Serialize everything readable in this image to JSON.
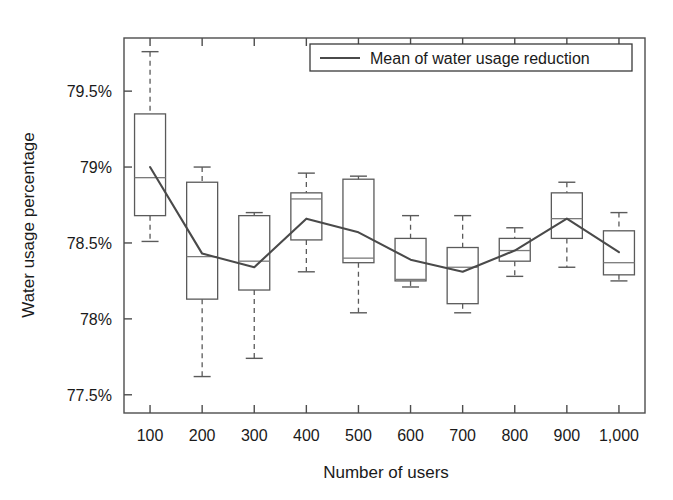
{
  "chart_data": {
    "type": "box",
    "title": "",
    "xlabel": "Number of users",
    "ylabel": "Water usage percentage",
    "categories": [
      "100",
      "200",
      "300",
      "400",
      "500",
      "600",
      "700",
      "800",
      "900",
      "1,000"
    ],
    "ylim": [
      77.38,
      79.85
    ],
    "ytick_values": [
      79.5,
      79,
      78.5,
      78,
      77.5
    ],
    "ytick_labels": [
      "79.5%",
      "79%",
      "78.5%",
      "78%",
      "77.5%"
    ],
    "grid": false,
    "legend_position": "top-right",
    "legend": [
      {
        "label": "Mean of water usage reduction",
        "marker": "line",
        "color": "#4a4a4a"
      }
    ],
    "boxes": [
      {
        "category": "100",
        "whisker_low": 78.51,
        "q1": 78.68,
        "median": 78.93,
        "q3": 79.35,
        "whisker_high": 79.76
      },
      {
        "category": "200",
        "whisker_low": 77.62,
        "q1": 78.13,
        "median": 78.41,
        "q3": 78.9,
        "whisker_high": 79.0
      },
      {
        "category": "300",
        "whisker_low": 77.74,
        "q1": 78.19,
        "median": 78.38,
        "q3": 78.68,
        "whisker_high": 78.7
      },
      {
        "category": "400",
        "whisker_low": 78.31,
        "q1": 78.52,
        "median": 78.79,
        "q3": 78.83,
        "whisker_high": 78.96
      },
      {
        "category": "500",
        "whisker_low": 78.04,
        "q1": 78.37,
        "median": 78.4,
        "q3": 78.92,
        "whisker_high": 78.94
      },
      {
        "category": "600",
        "whisker_low": 78.21,
        "q1": 78.25,
        "median": 78.26,
        "q3": 78.53,
        "whisker_high": 78.68
      },
      {
        "category": "700",
        "whisker_low": 78.04,
        "q1": 78.1,
        "median": 78.34,
        "q3": 78.47,
        "whisker_high": 78.68
      },
      {
        "category": "800",
        "whisker_low": 78.28,
        "q1": 78.38,
        "median": 78.45,
        "q3": 78.53,
        "whisker_high": 78.6
      },
      {
        "category": "900",
        "whisker_low": 78.34,
        "q1": 78.53,
        "median": 78.66,
        "q3": 78.83,
        "whisker_high": 78.9
      },
      {
        "category": "1,000",
        "whisker_low": 78.25,
        "q1": 78.29,
        "median": 78.37,
        "q3": 78.58,
        "whisker_high": 78.7
      }
    ],
    "series": [
      {
        "name": "Mean of water usage reduction",
        "values": [
          79.0,
          78.43,
          78.34,
          78.66,
          78.57,
          78.39,
          78.31,
          78.45,
          78.66,
          78.44
        ]
      }
    ],
    "colors": {
      "mean_line": "#4a4a4a",
      "box_stroke": "#5a5a5a",
      "median_stroke": "#7a7a7a",
      "axis": "#4d4d4d",
      "text": "#1a1a1a",
      "background": "#ffffff"
    }
  }
}
